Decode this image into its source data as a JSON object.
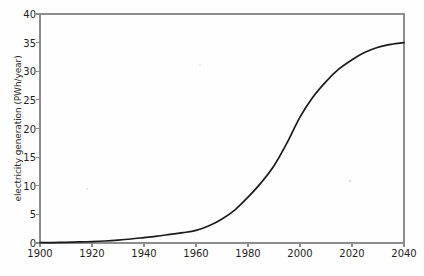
{
  "chart_data": {
    "type": "line",
    "title": "",
    "xlabel": "",
    "ylabel": "electricity generation (PWh/year)",
    "xlim": [
      1900,
      2040
    ],
    "ylim": [
      0,
      40
    ],
    "grid": false,
    "legend": null,
    "xticks": [
      1900,
      1920,
      1940,
      1960,
      1980,
      2000,
      2020,
      2040
    ],
    "yticks": [
      0,
      5,
      10,
      15,
      20,
      25,
      30,
      35,
      40
    ],
    "xtick_labels": [
      "1900",
      "1920",
      "1940",
      "1960",
      "1980",
      "2000",
      "2020",
      "2040"
    ],
    "ytick_labels": [
      "0",
      "5",
      "10",
      "15",
      "20",
      "25",
      "30",
      "35",
      "40"
    ],
    "series": [
      {
        "name": "electricity generation",
        "color": "#1b1b1b",
        "x": [
          1900,
          1905,
          1910,
          1915,
          1920,
          1925,
          1930,
          1935,
          1940,
          1945,
          1950,
          1955,
          1960,
          1965,
          1970,
          1975,
          1980,
          1985,
          1990,
          1995,
          2000,
          2005,
          2010,
          2015,
          2020,
          2025,
          2030,
          2035,
          2040
        ],
        "values": [
          0.05,
          0.08,
          0.12,
          0.18,
          0.25,
          0.35,
          0.5,
          0.7,
          0.95,
          1.2,
          1.5,
          1.8,
          2.2,
          3.0,
          4.2,
          5.8,
          8.0,
          10.5,
          13.5,
          17.5,
          22.0,
          25.5,
          28.2,
          30.4,
          32.0,
          33.3,
          34.2,
          34.7,
          35.0
        ]
      }
    ],
    "annotations": []
  },
  "axes": {
    "y_axis_title": "electricity generation (PWh/year)"
  }
}
